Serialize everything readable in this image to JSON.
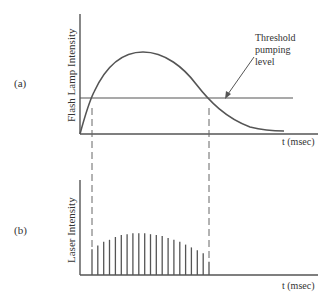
{
  "panel_a": {
    "tag": "(a)",
    "ylabel": "Flash Lamp Intensity",
    "xlabel": "t (msec)",
    "annotation": {
      "line1": "Threshold",
      "line2": "pumping",
      "line3": "level"
    },
    "curve_description": "Flash lamp pulse rises from zero, peaks, then decays; crosses threshold twice"
  },
  "panel_b": {
    "tag": "(b)",
    "ylabel": "Laser Intensity",
    "xlabel": "t (msec)",
    "spike_count": 21,
    "spike_relative_heights": [
      0.27,
      0.31,
      0.35,
      0.37,
      0.4,
      0.42,
      0.43,
      0.44,
      0.44,
      0.44,
      0.43,
      0.42,
      0.41,
      0.39,
      0.37,
      0.35,
      0.32,
      0.29,
      0.26,
      0.23,
      0.14
    ]
  },
  "colors": {
    "line": "#555555",
    "text": "#333333"
  }
}
